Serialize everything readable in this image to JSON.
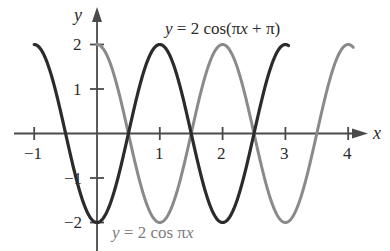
{
  "figure": {
    "background_color": "#ffffff",
    "axis_color": "#4a4a4a"
  },
  "axes": {
    "x_axis_name": "x",
    "y_axis_name": "y",
    "x_tick_labels": [
      "−1",
      "1",
      "2",
      "3",
      "4"
    ],
    "y_tick_labels": [
      "2",
      "1",
      "−1",
      "−2"
    ]
  },
  "labels": {
    "dark_curve": {
      "lhs": "y",
      "eq": " = 2 cos(",
      "arg_pi": "π",
      "arg_x": "x",
      "plus": " + ",
      "pi2": "π",
      "close": ")",
      "full_text": "y = 2 cos(πx + π)",
      "color": "#2b2b2b"
    },
    "gray_curve": {
      "lhs": "y",
      "eq": " = 2 cos ",
      "arg_pi": "π",
      "arg_x": "x",
      "full_text": "y = 2 cos πx",
      "color": "#7d7d7d"
    }
  },
  "chart_data": {
    "type": "line",
    "title": "",
    "xlabel": "x",
    "ylabel": "y",
    "xlim": [
      -1.08,
      4.15
    ],
    "ylim": [
      -2.45,
      2.35
    ],
    "xticks": [
      -1,
      1,
      2,
      3,
      4
    ],
    "yticks": [
      2,
      1,
      -1,
      -2
    ],
    "xtick_labels": [
      "−1",
      "1",
      "2",
      "3",
      "4"
    ],
    "ytick_labels": [
      "2",
      "1",
      "−1",
      "−2"
    ],
    "grid": false,
    "legend": "inline-annotations",
    "series": [
      {
        "name": "y = 2 cos(πx + π)",
        "expression": "2*cos(pi*x + pi)",
        "amplitude": 2,
        "period": 2,
        "phase_shift": 1,
        "color": "#2b2b2b",
        "linewidth": 3.2,
        "x_start": -1.0,
        "x_end": 3.05,
        "key_points": [
          {
            "x": -1.0,
            "y": 2.0
          },
          {
            "x": -0.5,
            "y": 0.0
          },
          {
            "x": 0.0,
            "y": -2.0
          },
          {
            "x": 0.5,
            "y": 0.0
          },
          {
            "x": 1.0,
            "y": 2.0
          },
          {
            "x": 1.5,
            "y": 0.0
          },
          {
            "x": 2.0,
            "y": -2.0
          },
          {
            "x": 2.5,
            "y": 0.0
          },
          {
            "x": 3.0,
            "y": 2.0
          }
        ]
      },
      {
        "name": "y = 2 cos πx",
        "expression": "2*cos(pi*x)",
        "amplitude": 2,
        "period": 2,
        "phase_shift": 0,
        "color": "#8a8a8a",
        "linewidth": 3.0,
        "x_start": 0.0,
        "x_end": 4.08,
        "key_points": [
          {
            "x": 0.0,
            "y": 2.0
          },
          {
            "x": 0.5,
            "y": 0.0
          },
          {
            "x": 1.0,
            "y": -2.0
          },
          {
            "x": 1.5,
            "y": 0.0
          },
          {
            "x": 2.0,
            "y": 2.0
          },
          {
            "x": 2.5,
            "y": 0.0
          },
          {
            "x": 3.0,
            "y": -2.0
          },
          {
            "x": 3.5,
            "y": 0.0
          },
          {
            "x": 4.0,
            "y": 2.0
          }
        ]
      }
    ],
    "annotations": [
      {
        "text": "y = 2 cos(πx + π)",
        "x": 1.5,
        "y": 2.35,
        "color": "#2b2b2b"
      },
      {
        "text": "y = 2 cos πx",
        "x": 0.8,
        "y": -2.35,
        "color": "#7d7d7d"
      }
    ]
  }
}
